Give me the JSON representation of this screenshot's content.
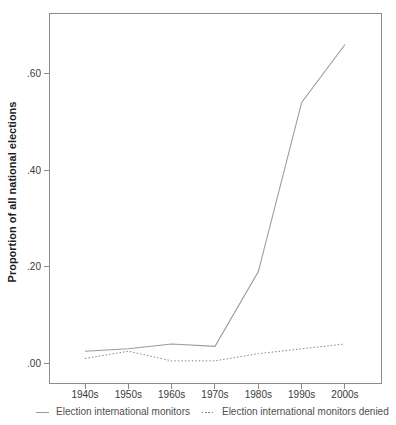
{
  "chart_data": {
    "type": "line",
    "categories": [
      "1940s",
      "1950s",
      "1960s",
      "1970s",
      "1980s",
      "1990s",
      "2000s"
    ],
    "series": [
      {
        "name": "Election international monitors",
        "style": "solid",
        "color": "#9b9b9b",
        "values": [
          0.025,
          0.03,
          0.04,
          0.035,
          0.19,
          0.54,
          0.66
        ]
      },
      {
        "name": "Election international monitors denied",
        "style": "dotted",
        "color": "#7e7e7e",
        "values": [
          0.01,
          0.025,
          0.005,
          0.005,
          0.02,
          0.03,
          0.04
        ]
      }
    ],
    "title": "",
    "xlabel": "",
    "ylabel": "Proportion of all national elections",
    "yticks": [
      0,
      0.2,
      0.4,
      0.6
    ],
    "ytick_labels": [
      ".00",
      ".20",
      ".40",
      ".60"
    ],
    "ylim": [
      0,
      0.725
    ],
    "grid": false,
    "legend_position": "bottom",
    "colors": {
      "axis": "#8c8c8c",
      "tick_text": "#3a3a3a",
      "legend_text": "#4f4f4f",
      "title_text": "#1c1c1c",
      "background": "#ffffff"
    }
  }
}
